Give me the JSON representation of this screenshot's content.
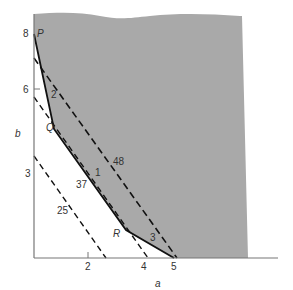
{
  "diagram": {
    "type": "feasible-region-plot",
    "axes": {
      "x_label": "a",
      "y_label": "b",
      "x_ticks": [
        "2",
        "4",
        "5"
      ],
      "y_ticks": [
        "8",
        "6",
        "3"
      ]
    },
    "region": {
      "fill_color": "#a9a9a9",
      "boundary_vertices": [
        "P",
        "Q",
        "R"
      ],
      "boundary_segment_labels": [
        "2",
        "1",
        "3"
      ]
    },
    "iso_lines": [
      {
        "label": "48"
      },
      {
        "label": "37"
      },
      {
        "label": "25"
      }
    ],
    "points": {
      "P": "P",
      "Q": "Q",
      "R": "R"
    }
  }
}
